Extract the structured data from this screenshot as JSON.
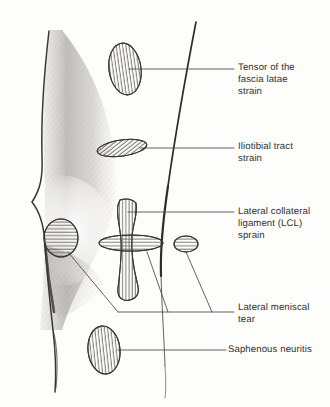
{
  "figure": {
    "kind": "anatomical-sketch",
    "background_color": "#fdfdfb",
    "ink_color": "#3a3836",
    "text_color": "#333231",
    "shading_color": "#8d8a86"
  },
  "labels": [
    {
      "id": "tensor-fascia-latae",
      "text": "Tensor of the\nfascia latae\nstrain",
      "x": 238,
      "y": 62
    },
    {
      "id": "iliotibial-tract",
      "text": "Iliotibial tract\nstrain",
      "x": 238,
      "y": 141
    },
    {
      "id": "lateral-collateral-ligament",
      "text": "Lateral collateral\nligament (LCL)\nsprain",
      "x": 238,
      "y": 206
    },
    {
      "id": "lateral-meniscal-tear",
      "text": "Lateral meniscal\ntear",
      "x": 238,
      "y": 302
    },
    {
      "id": "saphenous-neuritis",
      "text": "Saphenous neuritis",
      "x": 228,
      "y": 344
    }
  ],
  "lesions": [
    {
      "id": "tensor-fascia-latae-lesion",
      "shape": "oval",
      "hatch": "vertical",
      "cx": 125,
      "cy": 69,
      "rx": 16,
      "ry": 26,
      "rotate": -8
    },
    {
      "id": "iliotibial-tract-lesion",
      "shape": "elongated-oval",
      "hatch": "diagonal",
      "cx": 122,
      "cy": 148,
      "rx": 25,
      "ry": 8,
      "rotate": -8
    },
    {
      "id": "lateral-collateral-ligament-lesion",
      "shape": "ligament-band",
      "hatch": "vertical",
      "cx": 128,
      "cy": 250,
      "rx": 10,
      "ry": 52,
      "rotate": 0
    },
    {
      "id": "lateral-meniscus-lesion",
      "shape": "horizontal-bar",
      "hatch": "horizontal",
      "cx": 131,
      "cy": 243,
      "rx": 32,
      "ry": 8,
      "rotate": 0
    },
    {
      "id": "lateral-meniscus-posterior-lesion",
      "shape": "small-oval",
      "hatch": "horizontal",
      "cx": 186,
      "cy": 244,
      "rx": 12,
      "ry": 8,
      "rotate": 0
    },
    {
      "id": "pes-anserine-lesion",
      "shape": "oval",
      "hatch": "horizontal",
      "cx": 61,
      "cy": 238,
      "rx": 17,
      "ry": 19,
      "rotate": 0
    },
    {
      "id": "saphenous-neuritis-lesion",
      "shape": "oval",
      "hatch": "vertical",
      "cx": 104,
      "cy": 350,
      "rx": 16,
      "ry": 24,
      "rotate": -6
    }
  ],
  "leader_lines": [
    {
      "id": "leader-tensor-fascia-latae",
      "points": "129,69 234,69"
    },
    {
      "id": "leader-iliotibial-tract",
      "points": "140,148 234,148"
    },
    {
      "id": "leader-lateral-collateral-ligament",
      "points": "128,212 234,212"
    },
    {
      "id": "leader-meniscal-trunk",
      "points": "118,312 234,312"
    },
    {
      "id": "leader-meniscal-from-pes",
      "points": "68,252 118,312"
    },
    {
      "id": "leader-meniscal-from-bar",
      "points": "147,252 168,312"
    },
    {
      "id": "leader-meniscal-from-posterior",
      "points": "186,252 212,312"
    },
    {
      "id": "leader-saphenous-neuritis",
      "points": "118,350 226,350"
    }
  ]
}
